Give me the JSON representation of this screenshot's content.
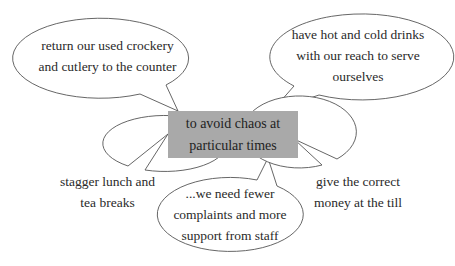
{
  "diagram": {
    "type": "mind-map / speech-bubble diagram",
    "center": {
      "lines": [
        "to avoid chaos at",
        "particular times"
      ],
      "fill": "#a9a9a9"
    },
    "bubbles": [
      {
        "id": "top-left",
        "lines": [
          "return our used crockery",
          "and cutlery to the counter"
        ]
      },
      {
        "id": "top-right",
        "lines": [
          "have hot and cold drinks",
          "with our reach to serve",
          "ourselves"
        ]
      },
      {
        "id": "bottom-left",
        "lines": [
          "stagger lunch and",
          "tea breaks"
        ]
      },
      {
        "id": "bottom-middle",
        "lines": [
          "...we need fewer",
          "complaints and more",
          "support from staff"
        ]
      },
      {
        "id": "bottom-right",
        "lines": [
          "give the correct",
          "money at the till"
        ]
      }
    ],
    "colors": {
      "stroke": "#555555",
      "bubble_fill": "#ffffff",
      "text": "#2a2a2a"
    }
  }
}
